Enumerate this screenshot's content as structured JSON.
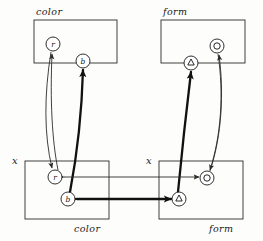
{
  "figure": {
    "title_top_left": "color",
    "title_top_right": "form",
    "label_bottom_left_var": "x",
    "label_bottom_right_var": "x",
    "caption_bottom_left": "color",
    "caption_bottom_right": "form"
  },
  "boxes": [
    {
      "id": "top-color",
      "label": "color",
      "x": 34,
      "y": 20,
      "w": 83,
      "h": 43
    },
    {
      "id": "top-form",
      "label": "form",
      "x": 161,
      "y": 20,
      "w": 84,
      "h": 43
    },
    {
      "id": "bottom-color",
      "label": "color",
      "var": "x",
      "x": 25,
      "y": 161,
      "w": 84,
      "h": 58
    },
    {
      "id": "bottom-form",
      "label": "form",
      "var": "x",
      "x": 159,
      "y": 161,
      "w": 84,
      "h": 58
    }
  ],
  "nodes": [
    {
      "id": "top-r",
      "label": "r",
      "glyph": "letter",
      "cx": 53,
      "cy": 44,
      "r": 7
    },
    {
      "id": "top-b",
      "label": "b",
      "glyph": "letter",
      "cx": 83,
      "cy": 61,
      "r": 7
    },
    {
      "id": "top-triangle",
      "label": "△",
      "glyph": "triangle",
      "cx": 191,
      "cy": 63,
      "r": 7
    },
    {
      "id": "top-circle",
      "label": "○",
      "glyph": "circle",
      "cx": 217,
      "cy": 46,
      "r": 7
    },
    {
      "id": "bot-r",
      "label": "r",
      "glyph": "letter",
      "cx": 55,
      "cy": 177,
      "r": 7
    },
    {
      "id": "bot-b",
      "label": "b",
      "glyph": "letter",
      "cx": 68,
      "cy": 199,
      "r": 7
    },
    {
      "id": "bot-circle",
      "label": "○",
      "glyph": "circle",
      "cx": 207,
      "cy": 178,
      "r": 7
    },
    {
      "id": "bot-triangle",
      "label": "△",
      "glyph": "triangle",
      "cx": 179,
      "cy": 199,
      "r": 7
    }
  ],
  "edges": [
    {
      "id": "edge-top-r-to-bot-r",
      "from": "top-r",
      "to": "bot-r",
      "weight": "thin",
      "direction": "down"
    },
    {
      "id": "edge-bot-b-to-top-b",
      "from": "bot-b",
      "to": "top-b",
      "weight": "thick",
      "direction": "up"
    },
    {
      "id": "edge-bot-circle-to-top-circle",
      "from": "bot-circle",
      "to": "top-circle",
      "weight": "thin",
      "direction": "up"
    },
    {
      "id": "edge-bot-triangle-to-top-triangle",
      "from": "bot-triangle",
      "to": "top-triangle",
      "weight": "thick",
      "direction": "up"
    },
    {
      "id": "edge-bot-r-bot-circle",
      "from": "bot-r",
      "to": "bot-circle",
      "weight": "thin",
      "direction": "both"
    },
    {
      "id": "edge-bot-b-bot-triangle",
      "from": "bot-b",
      "to": "bot-triangle",
      "weight": "thick",
      "direction": "both"
    }
  ]
}
